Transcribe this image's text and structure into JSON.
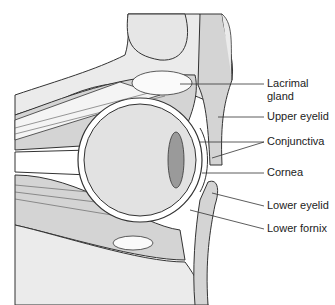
{
  "diagram": {
    "labels": [
      {
        "id": "lacrimal",
        "text_line1": "Lacrimal",
        "text_line2": "gland",
        "x": 267,
        "y": 77
      },
      {
        "id": "upper_eyelid",
        "text": "Upper eyelid",
        "x": 267,
        "y": 110
      },
      {
        "id": "conjunctiva",
        "text": "Conjunctiva",
        "x": 267,
        "y": 135
      },
      {
        "id": "cornea",
        "text": "Cornea",
        "x": 267,
        "y": 166
      },
      {
        "id": "lower_eyelid",
        "text": "Lower eyelid",
        "x": 267,
        "y": 199
      },
      {
        "id": "lower_fornix",
        "text": "Lower fornix",
        "x": 267,
        "y": 222
      }
    ],
    "colors": {
      "tissue": "#d4d4d4",
      "bone": "#ebebeb",
      "outline": "#333333",
      "eye": "#e2e2e2",
      "lens": "#9a9a9a"
    }
  }
}
